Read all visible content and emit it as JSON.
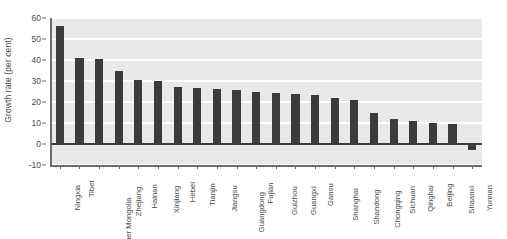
{
  "chart_data": {
    "type": "bar",
    "title": "",
    "xlabel": "",
    "ylabel": "Growth rate (per cent)",
    "ylim": [
      -10,
      60
    ],
    "yticks": [
      60,
      50,
      40,
      30,
      20,
      10,
      0,
      -10
    ],
    "grid": true,
    "legend": null,
    "bar_color": "#3b3b3d",
    "plot_background": "#e9e9e9",
    "gridline_color": "#ffffff",
    "categories": [
      "Ningxia",
      "Tibet",
      "Inner Mongolia",
      "Zhejiang",
      "Hainan",
      "Xinjiang",
      "Hebei",
      "Tianjin",
      "Jiangsu",
      "Guangdong",
      "Fujian",
      "Guizhou",
      "Guangxi",
      "Gansu",
      "Shanghai",
      "Shandong",
      "Chongqing",
      "Sichuan",
      "Qinghai",
      "Beijing",
      "Shaanxi",
      "Yunnan"
    ],
    "values": [
      56,
      41,
      40.5,
      35,
      30.5,
      30,
      27,
      26.5,
      26,
      25.5,
      25,
      24.5,
      24,
      23.5,
      22,
      21,
      15,
      12,
      11,
      10,
      9.5,
      -3
    ]
  }
}
